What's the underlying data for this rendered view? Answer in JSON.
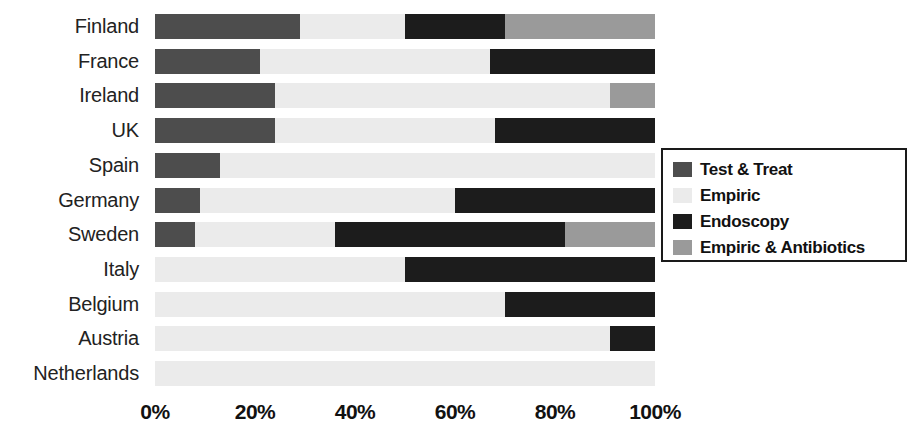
{
  "chart_data": {
    "type": "bar",
    "orientation": "horizontal",
    "stacked": true,
    "normalized": true,
    "title": "",
    "xlabel": "",
    "ylabel": "",
    "xlim": [
      0,
      100
    ],
    "grid": false,
    "legend_position": "right",
    "x_tick_labels": [
      "0%",
      "20%",
      "40%",
      "60%",
      "80%",
      "100%"
    ],
    "x_tick_values": [
      0,
      20,
      40,
      60,
      80,
      100
    ],
    "categories": [
      "Finland",
      "France",
      "Ireland",
      "UK",
      "Spain",
      "Germany",
      "Sweden",
      "Italy",
      "Belgium",
      "Austria",
      "Netherlands"
    ],
    "series": [
      {
        "name": "Test & Treat",
        "color": "#4d4d4d",
        "values": [
          29,
          21,
          24,
          24,
          13,
          9,
          8,
          0,
          0,
          0,
          0
        ]
      },
      {
        "name": "Empiric",
        "color": "#ebebeb",
        "values": [
          21,
          46,
          67,
          44,
          87,
          51,
          28,
          50,
          70,
          91,
          100
        ]
      },
      {
        "name": "Endoscopy",
        "color": "#1c1c1c",
        "values": [
          20,
          33,
          0,
          32,
          0,
          40,
          46,
          50,
          30,
          9,
          0
        ]
      },
      {
        "name": "Empiric & Antibiotics",
        "color": "#9a9a9a",
        "values": [
          30,
          0,
          9,
          0,
          0,
          0,
          18,
          0,
          0,
          0,
          0
        ]
      }
    ]
  },
  "legend": {
    "items": [
      {
        "label": "Test & Treat",
        "color": "#4d4d4d"
      },
      {
        "label": "Empiric",
        "color": "#ebebeb"
      },
      {
        "label": "Endoscopy",
        "color": "#1c1c1c"
      },
      {
        "label": "Empiric & Antibiotics",
        "color": "#9a9a9a"
      }
    ]
  }
}
